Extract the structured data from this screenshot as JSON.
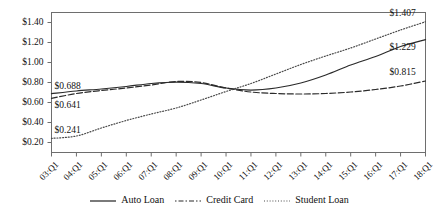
{
  "chart_data": {
    "type": "line",
    "title": "",
    "subtitle": "",
    "xlabel": "",
    "ylabel": "",
    "x": [
      "03:Q1",
      "04:Q1",
      "05:Q1",
      "06:Q1",
      "07:Q1",
      "08:Q1",
      "09:Q1",
      "10:Q1",
      "11:Q1",
      "12:Q1",
      "13:Q1",
      "14:Q1",
      "15:Q1",
      "16:Q1",
      "17:Q1",
      "18:Q1"
    ],
    "xlim": [
      0,
      15
    ],
    "ylim": [
      0.1,
      1.5
    ],
    "yticks": [
      0.2,
      0.4,
      0.6,
      0.8,
      1.0,
      1.2,
      1.4
    ],
    "ytick_labels": [
      "$0.20",
      "$0.40",
      "$0.60",
      "$0.80",
      "$1.00",
      "$1.20",
      "$1.40"
    ],
    "grid": false,
    "legend_position": "bottom-center",
    "series": [
      {
        "name": "Auto Loan",
        "style": "solid",
        "color": "#2b2b2b",
        "values": [
          0.688,
          0.715,
          0.735,
          0.76,
          0.79,
          0.805,
          0.79,
          0.745,
          0.725,
          0.745,
          0.795,
          0.875,
          0.975,
          1.06,
          1.16,
          1.229
        ]
      },
      {
        "name": "Credit Card",
        "style": "dashdot",
        "color": "#2b2b2b",
        "values": [
          0.641,
          0.69,
          0.72,
          0.745,
          0.775,
          0.81,
          0.8,
          0.745,
          0.705,
          0.69,
          0.685,
          0.69,
          0.705,
          0.73,
          0.765,
          0.815
        ]
      },
      {
        "name": "Student Loan",
        "style": "dotted",
        "color": "#4a4a4a",
        "values": [
          0.241,
          0.265,
          0.345,
          0.42,
          0.485,
          0.545,
          0.625,
          0.71,
          0.79,
          0.885,
          0.98,
          1.065,
          1.145,
          1.235,
          1.325,
          1.407
        ]
      }
    ],
    "annotations": [
      {
        "text": "$0.688",
        "series": "Auto Loan",
        "x": "03:Q1",
        "value": 0.688,
        "placement": "left-above"
      },
      {
        "text": "$0.641",
        "series": "Credit Card",
        "x": "03:Q1",
        "value": 0.641,
        "placement": "left-below"
      },
      {
        "text": "$0.241",
        "series": "Student Loan",
        "x": "03:Q1",
        "value": 0.241,
        "placement": "left-above"
      },
      {
        "text": "$1.407",
        "series": "Student Loan",
        "x": "18:Q1",
        "value": 1.407,
        "placement": "right-above"
      },
      {
        "text": "$1.229",
        "series": "Auto Loan",
        "x": "18:Q1",
        "value": 1.229,
        "placement": "right-below"
      },
      {
        "text": "$0.815",
        "series": "Credit Card",
        "x": "18:Q1",
        "value": 0.815,
        "placement": "right-above"
      }
    ]
  }
}
